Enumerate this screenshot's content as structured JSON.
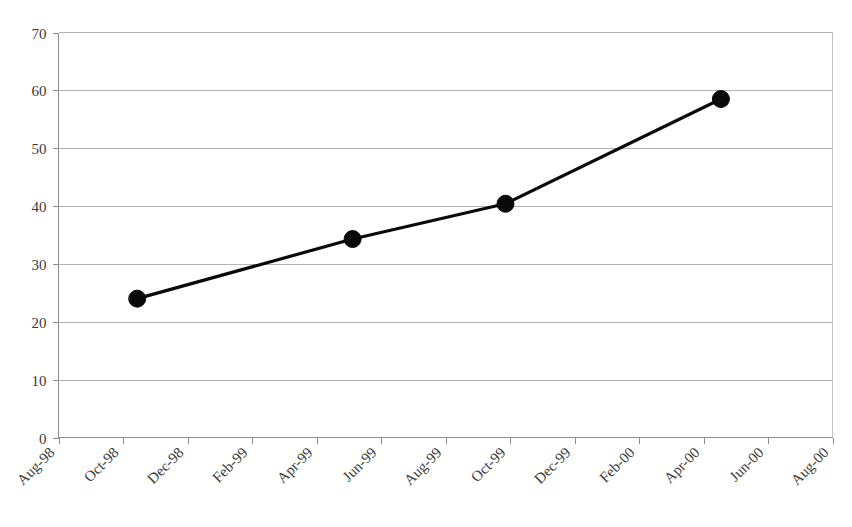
{
  "chart_data": {
    "type": "line",
    "title": "",
    "subtitle": "",
    "xlabel": "",
    "ylabel": "",
    "grid": true,
    "legend": false,
    "legend_position": "none",
    "ylim": [
      0,
      70
    ],
    "yticks": [
      0,
      10,
      20,
      30,
      40,
      50,
      60,
      70
    ],
    "ytick_labels": [
      "0",
      "10",
      "20",
      "30",
      "40",
      "50",
      "60",
      "70"
    ],
    "xtick_labels": [
      "Aug-98",
      "Oct-98",
      "Dec-98",
      "Feb-99",
      "Apr-99",
      "Jun-99",
      "Aug-99",
      "Oct-99",
      "Dec-99",
      "Feb-00",
      "Apr-00",
      "Jun-00",
      "Aug-00"
    ],
    "xtick_rotation_degrees": -45,
    "series": [
      {
        "name": "series-1",
        "color": "#0a0a0a",
        "marker": "filled-circle",
        "points": [
          {
            "x_label": "Sep-98",
            "x_index": 1.22,
            "value": 24.0
          },
          {
            "x_label": "May-99",
            "x_index": 4.56,
            "value": 34.3
          },
          {
            "x_label": "Oct-99",
            "x_index": 6.93,
            "value": 40.4
          },
          {
            "x_label": "May-00",
            "x_index": 10.27,
            "value": 58.5
          }
        ]
      }
    ]
  },
  "colors": {
    "series": "#0a0a0a",
    "gridline": "#b3b3b3",
    "axis": "#8c8c8c",
    "tick_text": "#3a3a3a",
    "background": "#ffffff"
  }
}
